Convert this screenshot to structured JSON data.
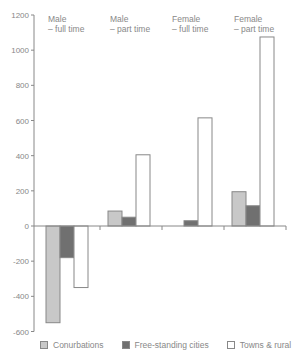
{
  "chart_data": {
    "type": "bar",
    "title": "",
    "xlabel": "",
    "ylabel": "",
    "ylim": [
      -600,
      1200
    ],
    "yticks": [
      1200,
      1000,
      800,
      600,
      400,
      200,
      0,
      -200,
      -400,
      -600
    ],
    "grid": false,
    "legend_position": "bottom",
    "categories": [
      "Male – full time",
      "Male – part time",
      "Female – full time",
      "Female – part time"
    ],
    "category_lines": [
      [
        "Male",
        "– full time"
      ],
      [
        "Male",
        "– part time"
      ],
      [
        "Female",
        "– full time"
      ],
      [
        "Female",
        "– part time"
      ]
    ],
    "series": [
      {
        "name": "Conurbations",
        "color": "#c8c8c8",
        "values": [
          -550,
          85,
          0,
          195
        ]
      },
      {
        "name": "Free-standing cities",
        "color": "#707070",
        "values": [
          -180,
          50,
          30,
          115
        ]
      },
      {
        "name": "Towns & rural",
        "color": "#ffffff",
        "values": [
          -350,
          405,
          615,
          1075
        ]
      }
    ]
  },
  "legend": {
    "items": [
      {
        "label": "Conurbations",
        "color": "#c8c8c8"
      },
      {
        "label": "Free-standing cities",
        "color": "#707070"
      },
      {
        "label": "Towns & rural",
        "color": "#ffffff"
      }
    ]
  }
}
